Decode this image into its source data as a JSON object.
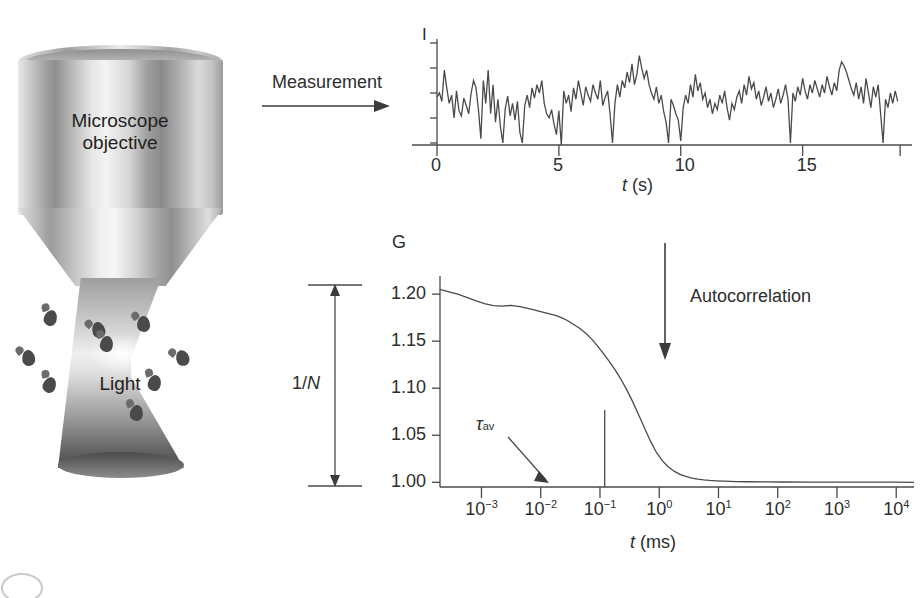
{
  "figure": {
    "domain": "scientific-diagram",
    "topic": "Fluorescence correlation spectroscopy",
    "background_color": "#ffffff",
    "ink_color": "#2d2d2d"
  },
  "illustration": {
    "name": "microscope-objective-and-light-cone",
    "objective_label_line1": "Microscope",
    "objective_label_line2": "objective",
    "light_label": "Light",
    "particle_count": 9
  },
  "arrows": {
    "measurement": {
      "label": "Measurement",
      "direction": "right"
    },
    "autocorrelation": {
      "label": "Autocorrelation",
      "direction": "down"
    }
  },
  "amplitude_bracket": {
    "label_prefix": "1/",
    "label_italic": "N",
    "label_full": "1/N",
    "from_value": 1.0,
    "to_value": 1.2
  },
  "chart_data": [
    {
      "id": "intensity-trace",
      "type": "line",
      "title": "",
      "ylabel": "I",
      "xlabel": "t (ms)",
      "xlabel_italic": "t",
      "xlabel_unit": "(s)",
      "x_ticks": [
        0,
        5,
        10,
        15
      ],
      "x_tick_labels": [
        "0",
        "5",
        "10",
        "15"
      ],
      "xlim": [
        0,
        19.2
      ],
      "ylim": [
        0,
        1
      ],
      "y_ticks_unlabeled": 5,
      "grid": false,
      "legend": null,
      "description": "Noisy fluorescence intensity fluctuation time trace",
      "x": [
        0.0,
        0.1,
        0.2,
        0.3,
        0.4,
        0.5,
        0.6,
        0.7,
        0.8,
        0.9,
        1.0,
        1.1,
        1.2,
        1.3,
        1.4,
        1.5,
        1.6,
        1.7,
        1.8,
        1.9,
        2.0,
        2.1,
        2.2,
        2.3,
        2.4,
        2.5,
        2.6,
        2.7,
        2.8,
        2.9,
        3.0,
        3.1,
        3.2,
        3.3,
        3.4,
        3.5,
        3.6,
        3.7,
        3.8,
        3.9,
        4.0,
        4.1,
        4.2,
        4.3,
        4.4,
        4.5,
        4.6,
        4.7,
        4.8,
        4.9,
        5.0,
        5.1,
        5.2,
        5.3,
        5.4,
        5.5,
        5.6,
        5.7,
        5.8,
        5.9,
        6.0,
        6.1,
        6.2,
        6.3,
        6.4,
        6.5,
        6.6,
        6.7,
        6.8,
        6.9,
        7.0,
        7.1,
        7.2,
        7.3,
        7.4,
        7.5,
        7.6,
        7.7,
        7.8,
        7.9,
        8.0,
        8.1,
        8.2,
        8.3,
        8.4,
        8.5,
        8.6,
        8.7,
        8.8,
        8.9,
        9.0,
        9.1,
        9.2,
        9.3,
        9.4,
        9.5,
        9.6,
        9.7,
        9.8,
        9.9,
        10.0,
        10.1,
        10.2,
        10.3,
        10.4,
        10.5,
        10.6,
        10.7,
        10.8,
        10.9,
        11.0,
        11.1,
        11.2,
        11.3,
        11.4,
        11.5,
        11.6,
        11.7,
        11.8,
        11.9,
        12.0,
        12.1,
        12.2,
        12.3,
        12.4,
        12.5,
        12.6,
        12.7,
        12.8,
        12.9,
        13.0,
        13.1,
        13.2,
        13.3,
        13.4,
        13.5,
        13.6,
        13.7,
        13.8,
        13.9,
        14.0,
        14.1,
        14.2,
        14.3,
        14.4,
        14.5,
        14.6,
        14.7,
        14.8,
        14.9,
        15.0,
        15.1,
        15.2,
        15.3,
        15.4,
        15.5,
        15.6,
        15.7,
        15.8,
        15.9,
        16.0,
        16.1,
        16.2,
        16.3,
        16.4,
        16.5,
        16.6,
        16.7,
        16.8,
        16.9,
        17.0,
        17.1,
        17.2,
        17.3,
        17.4,
        17.5,
        17.6,
        17.7,
        17.8,
        17.9,
        18.0,
        18.1,
        18.2,
        18.3,
        18.4,
        18.5,
        18.6,
        18.7,
        18.8,
        18.9,
        19.0,
        19.1,
        19.2
      ],
      "y": [
        0.46,
        0.5,
        0.42,
        0.72,
        0.55,
        0.4,
        0.48,
        0.26,
        0.52,
        0.33,
        0.28,
        0.45,
        0.38,
        0.3,
        0.5,
        0.62,
        0.55,
        0.34,
        0.06,
        0.62,
        0.4,
        0.72,
        0.3,
        0.58,
        0.22,
        0.44,
        0.18,
        0.02,
        0.35,
        0.47,
        0.28,
        0.4,
        0.24,
        0.42,
        0.12,
        0.02,
        0.38,
        0.48,
        0.36,
        0.55,
        0.45,
        0.58,
        0.5,
        0.62,
        0.4,
        0.3,
        0.26,
        0.34,
        0.2,
        0.1,
        0.33,
        0.0,
        0.52,
        0.4,
        0.48,
        0.32,
        0.55,
        0.44,
        0.62,
        0.5,
        0.38,
        0.56,
        0.48,
        0.42,
        0.58,
        0.5,
        0.44,
        0.62,
        0.38,
        0.46,
        0.52,
        0.3,
        0.02,
        0.4,
        0.58,
        0.46,
        0.62,
        0.55,
        0.7,
        0.6,
        0.78,
        0.58,
        0.68,
        0.86,
        0.74,
        0.64,
        0.72,
        0.58,
        0.5,
        0.44,
        0.56,
        0.4,
        0.48,
        0.32,
        0.22,
        0.02,
        0.44,
        0.38,
        0.3,
        0.24,
        0.04,
        0.36,
        0.48,
        0.4,
        0.58,
        0.46,
        0.68,
        0.52,
        0.6,
        0.44,
        0.5,
        0.36,
        0.44,
        0.3,
        0.4,
        0.34,
        0.48,
        0.4,
        0.52,
        0.36,
        0.24,
        0.4,
        0.34,
        0.46,
        0.52,
        0.4,
        0.58,
        0.48,
        0.66,
        0.54,
        0.6,
        0.44,
        0.52,
        0.38,
        0.46,
        0.56,
        0.42,
        0.5,
        0.36,
        0.44,
        0.54,
        0.4,
        0.48,
        0.58,
        0.44,
        0.02,
        0.5,
        0.42,
        0.56,
        0.48,
        0.64,
        0.52,
        0.44,
        0.58,
        0.5,
        0.62,
        0.54,
        0.46,
        0.58,
        0.5,
        0.66,
        0.56,
        0.48,
        0.6,
        0.52,
        0.72,
        0.8,
        0.76,
        0.7,
        0.62,
        0.54,
        0.48,
        0.6,
        0.44,
        0.56,
        0.4,
        0.64,
        0.5,
        0.36,
        0.56,
        0.46,
        0.58,
        0.3,
        0.02,
        0.44,
        0.36,
        0.5,
        0.4,
        0.52,
        0.42
      ]
    },
    {
      "id": "autocorrelation-curve",
      "type": "line",
      "title": "",
      "ylabel": "G",
      "xlabel": "t (ms)",
      "xlabel_italic": "t",
      "xlabel_unit": "(ms)",
      "xscale": "log",
      "x_tick_labels": [
        "10−3",
        "10−2",
        "10−1",
        "10⁰",
        "10¹",
        "10²",
        "10³",
        "10⁴"
      ],
      "x_tick_exponents": [
        -3,
        -2,
        -1,
        0,
        1,
        2,
        3,
        4
      ],
      "xlim_exponent": [
        -3.7,
        4.3
      ],
      "y_ticks": [
        1.0,
        1.05,
        1.1,
        1.15,
        1.2
      ],
      "y_tick_labels": [
        "1.00",
        "1.05",
        "1.10",
        "1.15",
        "1.20"
      ],
      "ylim": [
        0.995,
        1.215
      ],
      "grid": false,
      "legend": null,
      "annotation": {
        "label": "τ",
        "label_subscript": "av",
        "marker_x_exponent": -0.92,
        "marker_type": "vertical-line"
      },
      "description": "Autocorrelation function G decaying from 1.205 to 1.00",
      "x_log": [
        -3.7,
        -3.55,
        -3.4,
        -3.25,
        -3.1,
        -2.95,
        -2.8,
        -2.65,
        -2.5,
        -2.35,
        -2.2,
        -2.05,
        -1.95,
        -1.85,
        -1.75,
        -1.65,
        -1.55,
        -1.45,
        -1.35,
        -1.25,
        -1.15,
        -1.05,
        -0.95,
        -0.85,
        -0.75,
        -0.65,
        -0.55,
        -0.45,
        -0.35,
        -0.25,
        -0.15,
        -0.05,
        0.05,
        0.15,
        0.25,
        0.35,
        0.45,
        0.55,
        0.65,
        0.75,
        0.85,
        0.95,
        1.1,
        1.3,
        1.5,
        1.8,
        2.1,
        2.5,
        3.0,
        3.5,
        4.0,
        4.3
      ],
      "y_val": [
        1.205,
        1.2025,
        1.2,
        1.1965,
        1.193,
        1.19,
        1.1878,
        1.1872,
        1.188,
        1.1868,
        1.1845,
        1.1822,
        1.1805,
        1.179,
        1.1775,
        1.175,
        1.172,
        1.168,
        1.164,
        1.159,
        1.153,
        1.1455,
        1.1375,
        1.129,
        1.12,
        1.11,
        1.0985,
        1.086,
        1.072,
        1.058,
        1.044,
        1.032,
        1.023,
        1.0165,
        1.0118,
        1.0085,
        1.0062,
        1.0045,
        1.0034,
        1.0026,
        1.002,
        1.0016,
        1.0012,
        1.0008,
        1.0006,
        1.0004,
        1.0003,
        1.0002,
        1.0002,
        1.0001,
        1.0001,
        1.0
      ]
    }
  ]
}
